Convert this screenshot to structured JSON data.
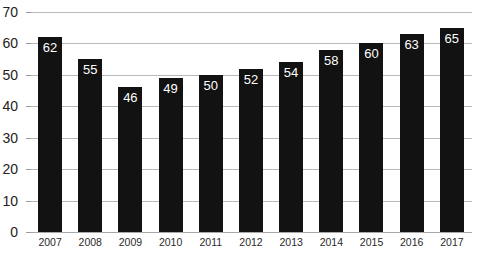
{
  "chart_data": {
    "type": "bar",
    "title": "",
    "subtitle": "",
    "xlabel": "",
    "ylabel": "",
    "categories": [
      "2007",
      "2008",
      "2009",
      "2010",
      "2011",
      "2012",
      "2013",
      "2014",
      "2015",
      "2016",
      "2017"
    ],
    "values": [
      62,
      55,
      46,
      49,
      50,
      52,
      54,
      58,
      60,
      63,
      65
    ],
    "data_labels": [
      "62",
      "55",
      "46",
      "49",
      "50",
      "52",
      "54",
      "58",
      "60",
      "63",
      "65"
    ],
    "ylim": [
      0,
      70
    ],
    "ytick_values": [
      0,
      10,
      20,
      30,
      40,
      50,
      60,
      70
    ],
    "ytick_labels": [
      "0",
      "10",
      "20",
      "30",
      "40",
      "50",
      "60",
      "70"
    ],
    "grid": true,
    "grid_axis": "y",
    "legend": false,
    "legend_position": "none",
    "annotations": [],
    "colors": {
      "bar": "#121212",
      "data_label": "#ffffff",
      "gridline": "#b9b9b9",
      "axis_line": "#a8a8a8",
      "tick_label": "#222222",
      "background": "#ffffff"
    }
  }
}
